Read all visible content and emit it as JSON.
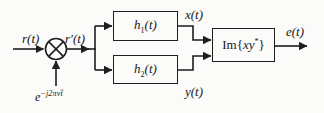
{
  "figure": {
    "type": "block-diagram",
    "colors": {
      "background": "#fbfbfa",
      "line": "#1e1e1e",
      "text": "#171717"
    },
    "labels": {
      "input_signal": "r(t)",
      "mixed_signal": "r′(t)",
      "output_x": "x(t)",
      "output_y": "y(t)",
      "error_signal": "e(t)"
    },
    "oscillator": {
      "base": "e",
      "exponent": "−j2πν̂t"
    },
    "blocks": {
      "filter1": {
        "base": "h",
        "sub": "1",
        "arg": "(t)"
      },
      "filter2": {
        "base": "h",
        "sub": "2",
        "arg": "(t)"
      },
      "detector": {
        "prefix": "Im{",
        "vars": "xy",
        "sup": "*",
        "suffix": "}"
      }
    },
    "icons": {
      "multiplier": "multiply-circle-icon"
    }
  }
}
